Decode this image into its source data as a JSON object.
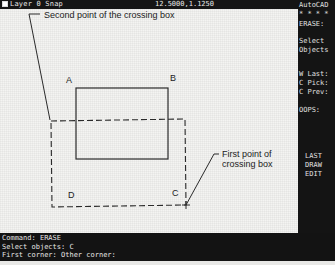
{
  "status_bar": {
    "layer_label": "Layer 0 Snap",
    "coordinates": "12.5000,1.1250"
  },
  "side_menu": {
    "items": [
      {
        "label": "AutoCAD",
        "top": 1
      },
      {
        "label": "* * * *",
        "top": 10
      },
      {
        "label": "ERASE:",
        "top": 20
      },
      {
        "label": "Select",
        "top": 37
      },
      {
        "label": "Objects",
        "top": 46
      },
      {
        "label": "W Last:",
        "top": 70
      },
      {
        "label": "C Pick:",
        "top": 79
      },
      {
        "label": "C Prev:",
        "top": 88
      },
      {
        "label": "OOPS:",
        "top": 106
      },
      {
        "label": "LAST",
        "top": 152
      },
      {
        "label": "DRAW",
        "top": 161
      },
      {
        "label": "EDIT",
        "top": 170
      }
    ]
  },
  "drawing": {
    "annotations": {
      "second_point": "Second point of the crossing box",
      "first_point_line1": "First point of",
      "first_point_line2": "crossing box"
    },
    "vertex_labels": {
      "a": "A",
      "b": "B",
      "c": "C",
      "d": "D"
    }
  },
  "command_area": {
    "lines": [
      "Command: ERASE",
      "Select objects: C",
      "First corner: Other corner:"
    ]
  }
}
